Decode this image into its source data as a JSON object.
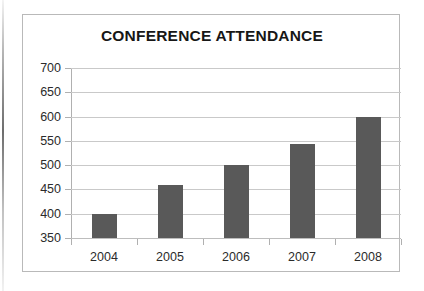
{
  "chart_data": {
    "type": "bar",
    "title": "CONFERENCE ATTENDANCE",
    "xlabel": "",
    "ylabel": "",
    "categories": [
      "2004",
      "2005",
      "2006",
      "2007",
      "2008"
    ],
    "values": [
      400,
      460,
      500,
      543,
      600
    ],
    "series": [
      {
        "name": "Attendance",
        "values": [
          400,
          460,
          500,
          543,
          600
        ]
      }
    ],
    "ylim": [
      350,
      700
    ],
    "ytick_step": 50,
    "ytick_labels": [
      "700",
      "650",
      "600",
      "550",
      "500",
      "450",
      "400",
      "350"
    ],
    "ytick_values": [
      700,
      650,
      600,
      550,
      500,
      450,
      400,
      350
    ],
    "grid": true,
    "legend": false,
    "legend_position": "none",
    "bar_color": "#595959",
    "gridline_color": "#c9c9c9",
    "axis_color": "#b0b0b0",
    "frame_color": "#b9b9b9",
    "title_color": "#171717",
    "tick_label_color": "#2b2b2b",
    "background_color": "#ffffff"
  }
}
